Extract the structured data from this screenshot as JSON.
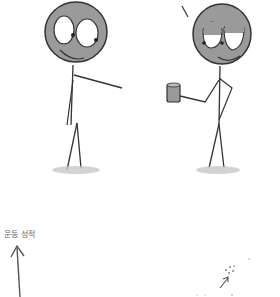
{
  "comic": {
    "panel_top": {
      "left_figure": {
        "description": "wide-eyed stick figure pointing",
        "face": "smiling"
      },
      "right_figure": {
        "description": "sleepy-eyed stick figure holding mug",
        "face": "smug"
      }
    },
    "panel_bottom": {
      "axis_label": "운동 성적",
      "annotation": "..."
    }
  },
  "colors": {
    "ink": "#333333",
    "head_fill": "#9a9a9a",
    "shadow": "#c8c8c8"
  }
}
